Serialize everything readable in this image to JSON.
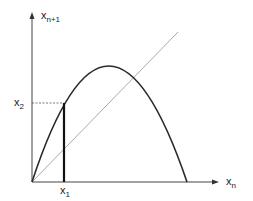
{
  "diagram": {
    "type": "cobweb-logistic-map",
    "axes": {
      "y_label": "x",
      "y_label_sub": "n+1",
      "x_label": "x",
      "x_label_sub": "n"
    },
    "points": {
      "x1_label": "x",
      "x1_sub": "1",
      "x2_label": "x",
      "x2_sub": "2"
    },
    "colors": {
      "axis": "#444444",
      "curve": "#2a2a2a",
      "diagonal": "#aaaaaa",
      "guide": "#555555"
    }
  }
}
